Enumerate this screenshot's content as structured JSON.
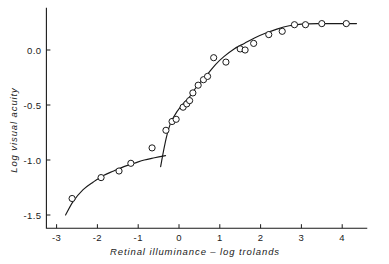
{
  "figure": {
    "background_color": "#ffffff",
    "ink_color": "#1a1a1a"
  },
  "chart_data": {
    "type": "scatter",
    "title": "",
    "subtitle": "",
    "xlabel": "Retinal illuminance – log trolands",
    "ylabel": "Log visual acuity",
    "xlim": [
      -3.25,
      4.6
    ],
    "ylim": [
      -1.62,
      0.38
    ],
    "grid": false,
    "legend": null,
    "xticks": [
      -3,
      -2,
      -1,
      0,
      1,
      2,
      3,
      4
    ],
    "xtick_labels": [
      "-3",
      "-2",
      "-1",
      "0",
      "1",
      "2",
      "3",
      "4"
    ],
    "yticks": [
      0.0,
      -0.5,
      -1.0,
      -1.5
    ],
    "ytick_labels": [
      "0.0",
      "-0.5",
      "-1.0",
      "-1.5"
    ],
    "annotations": [],
    "series": [
      {
        "name": "Rod branch (scotopic) data points",
        "marker": "open-circle",
        "x": [
          -2.62,
          -1.91,
          -1.47,
          -1.18,
          -0.66
        ],
        "y": [
          -1.35,
          -1.16,
          -1.1,
          -1.03,
          -0.89
        ]
      },
      {
        "name": "Cone branch (photopic) data points",
        "marker": "open-circle",
        "x": [
          -0.32,
          -0.17,
          -0.07,
          0.1,
          0.19,
          0.26,
          0.34,
          0.47,
          0.6,
          0.7,
          0.85,
          1.15,
          1.5,
          1.62,
          1.83,
          2.2,
          2.53,
          2.83,
          3.1,
          3.5,
          4.1
        ],
        "y": [
          -0.73,
          -0.65,
          -0.63,
          -0.52,
          -0.49,
          -0.46,
          -0.39,
          -0.32,
          -0.27,
          -0.24,
          -0.07,
          -0.11,
          0.01,
          0.0,
          0.06,
          0.14,
          0.17,
          0.23,
          0.23,
          0.24,
          0.24
        ]
      }
    ],
    "curves": [
      {
        "name": "rod-branch-fit",
        "description": "Shallow lower curve rising from (-2.78, -1.50) to a flat end near (-0.33, -0.96)",
        "points": [
          [
            -2.78,
            -1.5
          ],
          [
            -2.6,
            -1.38
          ],
          [
            -2.35,
            -1.27
          ],
          [
            -2.1,
            -1.2
          ],
          [
            -1.85,
            -1.14
          ],
          [
            -1.6,
            -1.1
          ],
          [
            -1.35,
            -1.06
          ],
          [
            -1.1,
            -1.03
          ],
          [
            -0.85,
            -1.0
          ],
          [
            -0.6,
            -0.98
          ],
          [
            -0.33,
            -0.96
          ]
        ]
      },
      {
        "name": "cone-branch-fit",
        "description": "Steep sigmoid rising from (-0.45, -1.06) through the inflection near (0.45, -0.32) to the plateau at 0.24",
        "points": [
          [
            -0.45,
            -1.06
          ],
          [
            -0.38,
            -0.92
          ],
          [
            -0.3,
            -0.78
          ],
          [
            -0.2,
            -0.66
          ],
          [
            -0.05,
            -0.56
          ],
          [
            0.1,
            -0.49
          ],
          [
            0.25,
            -0.43
          ],
          [
            0.4,
            -0.35
          ],
          [
            0.55,
            -0.28
          ],
          [
            0.7,
            -0.22
          ],
          [
            0.9,
            -0.13
          ],
          [
            1.1,
            -0.06
          ],
          [
            1.35,
            0.01
          ],
          [
            1.6,
            0.06
          ],
          [
            1.85,
            0.11
          ],
          [
            2.1,
            0.15
          ],
          [
            2.4,
            0.19
          ],
          [
            2.7,
            0.22
          ],
          [
            3.0,
            0.235
          ],
          [
            3.4,
            0.24
          ],
          [
            3.9,
            0.24
          ],
          [
            4.35,
            0.24
          ]
        ]
      }
    ]
  }
}
